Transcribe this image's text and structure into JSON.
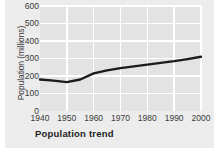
{
  "chart_data": {
    "type": "line",
    "title": "Population trend",
    "xlabel": "",
    "ylabel": "Population (millions)",
    "xlim": [
      1940,
      2000
    ],
    "ylim": [
      0,
      600
    ],
    "grid": true,
    "legend_position": "none",
    "xticks": [
      "1940",
      "1950",
      "1960",
      "1970",
      "1980",
      "1990",
      "2000"
    ],
    "yticks": [
      "0",
      "100",
      "200",
      "300",
      "400",
      "500",
      "600"
    ],
    "x": [
      1940,
      1945,
      1950,
      1955,
      1960,
      1965,
      1970,
      1975,
      1980,
      1985,
      1990,
      1995,
      2000
    ],
    "values": [
      180,
      174,
      165,
      180,
      215,
      232,
      245,
      255,
      265,
      275,
      285,
      297,
      310
    ],
    "series": [
      {
        "name": "Population",
        "color": "#1a1a1a",
        "values": [
          180,
          174,
          165,
          180,
          215,
          232,
          245,
          255,
          265,
          275,
          285,
          297,
          310
        ]
      }
    ],
    "colors": {
      "line": "#1a1a1a",
      "plot_background": "#e3e3e3",
      "panel_background": "#ececec",
      "gridline": "#ffffff",
      "tick_text": "#3b3b3b",
      "title_text": "#1d1d1d"
    }
  }
}
